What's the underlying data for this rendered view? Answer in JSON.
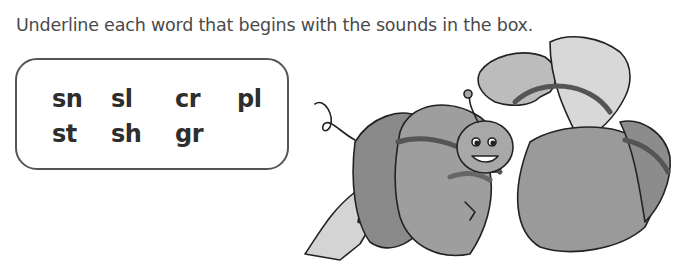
{
  "worksheet": {
    "instruction": "Underline each word that begins with the sounds in the box.",
    "sound_box": {
      "row1": [
        "sn",
        "sl",
        "cr",
        "pl"
      ],
      "row2": [
        "st",
        "sh",
        "gr"
      ]
    },
    "illustration": {
      "description": "Smiling caterpillar nestled among large leaves"
    }
  }
}
